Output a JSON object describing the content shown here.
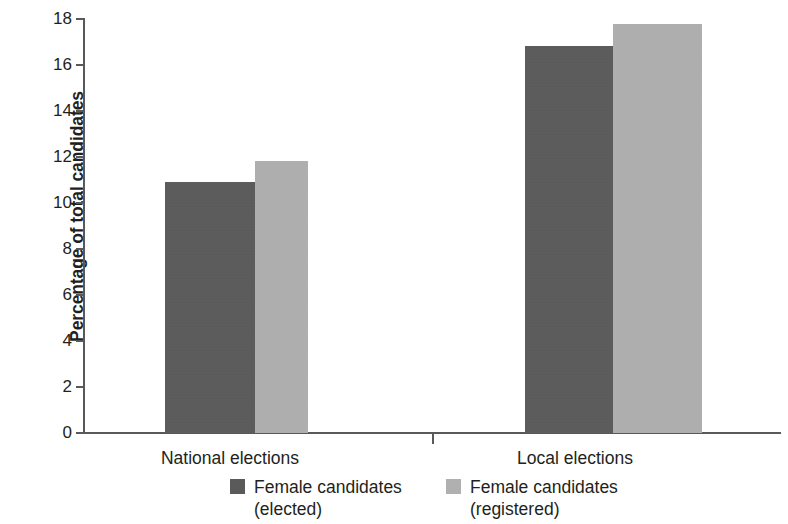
{
  "chart_data": {
    "type": "bar",
    "title": "",
    "subtitle": "",
    "xlabel": "",
    "ylabel": "Percentage of total candidates",
    "categories": [
      "National elections",
      "Local elections"
    ],
    "series": [
      {
        "name": "Female candidates (elected)",
        "legend_line1": "Female candidates",
        "legend_line2": "(elected)",
        "color": "#5a5a5a",
        "values": [
          10.9,
          16.8
        ]
      },
      {
        "name": "Female candidates (registered)",
        "legend_line1": "Female candidates",
        "legend_line2": "(registered)",
        "color": "#b0b0b0",
        "values": [
          11.8,
          17.75
        ]
      }
    ],
    "ylim": [
      0,
      18
    ],
    "ytick_values": [
      0,
      2,
      4,
      6,
      8,
      10,
      12,
      14,
      16,
      18
    ],
    "ytick_labels": [
      "0",
      "2",
      "4",
      "6",
      "8",
      "10",
      "12",
      "14",
      "16",
      "18"
    ],
    "grid": false,
    "legend_position": "bottom"
  },
  "axis": {
    "y_title": "Percentage of total candidates",
    "ticks": [
      "18",
      "16",
      "14",
      "12",
      "10",
      "8",
      "6",
      "4",
      "2",
      "0"
    ]
  },
  "categories": [
    {
      "label": "National elections"
    },
    {
      "label": "Local elections"
    }
  ],
  "legend": [
    {
      "line1": "Female candidates",
      "line2": "(elected)",
      "color": "#5a5a5a"
    },
    {
      "line1": "Female candidates",
      "line2": "(registered)",
      "color": "#b0b0b0"
    }
  ]
}
